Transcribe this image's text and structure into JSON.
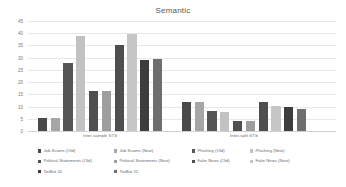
{
  "chart_data": {
    "type": "bar",
    "title": "Semantic",
    "xlabel": "",
    "ylabel": "",
    "ylim": [
      0,
      45
    ],
    "yticks": [
      0,
      5,
      10,
      15,
      20,
      25,
      30,
      35,
      40,
      45
    ],
    "grid": true,
    "legend_position": "bottom",
    "categories": [
      "Inter-sample STS",
      "Inter-split STS"
    ],
    "series": [
      {
        "name": "Job Scams (Old)",
        "color": "#4a4a4a",
        "values": [
          5.5,
          11.7
        ]
      },
      {
        "name": "Job Scams (New)",
        "color": "#a6a6a6",
        "values": [
          5.5,
          11.8
        ]
      },
      {
        "name": "Phishing (Old)",
        "color": "#555555",
        "values": [
          27.7,
          8.2
        ]
      },
      {
        "name": "Phishing (New)",
        "color": "#c2c2c2",
        "values": [
          39.0,
          7.9
        ]
      },
      {
        "name": "Political Statements (Old)",
        "color": "#505050",
        "values": [
          16.3,
          3.9
        ]
      },
      {
        "name": "Political Statements (New)",
        "color": "#9e9e9e",
        "values": [
          16.2,
          4.0
        ]
      },
      {
        "name": "Fake News (Old)",
        "color": "#4e4e4e",
        "values": [
          35.0,
          11.8
        ]
      },
      {
        "name": "Fake News (New)",
        "color": "#c6c6c6",
        "values": [
          39.7,
          10.2
        ]
      },
      {
        "name": "TwiBot 20",
        "color": "#3d3d3d",
        "values": [
          29.0,
          9.8
        ]
      },
      {
        "name": "TwiBot 22",
        "color": "#6e6e6e",
        "values": [
          29.3,
          9.2
        ]
      }
    ]
  }
}
